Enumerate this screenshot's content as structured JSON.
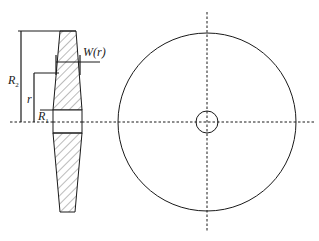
{
  "figure": {
    "type": "engineering-drawing",
    "labels": {
      "outer_radius": {
        "main": "R",
        "sub": "2"
      },
      "radius": "r",
      "inner_radius": {
        "main": "R",
        "sub": "1"
      },
      "width": "W(r)"
    },
    "colors": {
      "stroke": "#1a1a1a",
      "hatch": "#555555",
      "background": "#ffffff"
    }
  }
}
